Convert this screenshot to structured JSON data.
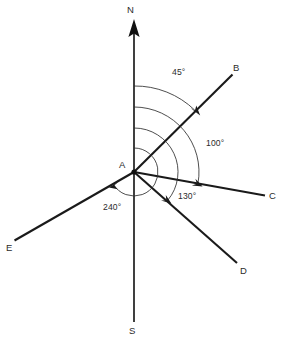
{
  "figure": {
    "type": "bearing-diagram",
    "vertex_label": "A",
    "north_label": "N",
    "south_label": "S"
  },
  "points": [
    {
      "label": "A",
      "name": "vertex"
    },
    {
      "label": "B",
      "name": "point-b"
    },
    {
      "label": "C",
      "name": "point-c"
    },
    {
      "label": "D",
      "name": "point-d"
    },
    {
      "label": "E",
      "name": "point-e"
    },
    {
      "label": "N",
      "name": "north"
    },
    {
      "label": "S",
      "name": "south"
    }
  ],
  "bearings": [
    {
      "target": "B",
      "label": "45°",
      "degrees": 45
    },
    {
      "target": "C",
      "label": "100°",
      "degrees": 100
    },
    {
      "target": "D",
      "label": "130°",
      "degrees": 130
    },
    {
      "target": "E",
      "label": "240°",
      "degrees": 240
    }
  ],
  "labels": {
    "a": "A",
    "b": "B",
    "c": "C",
    "d": "D",
    "e": "E",
    "n": "N",
    "s": "S",
    "ang45": "45°",
    "ang100": "100°",
    "ang130": "130°",
    "ang240": "240°"
  },
  "colors": {
    "line": "#1a1a1a",
    "arc": "#2e2e2e",
    "text": "#2b2b2b",
    "background": "#ffffff"
  }
}
